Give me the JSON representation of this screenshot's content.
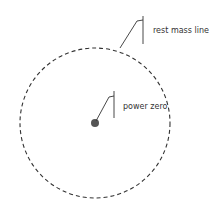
{
  "diagram": {
    "labels": {
      "rest_mass_line": "rest mass line",
      "power_zero": "power zero"
    },
    "colors": {
      "line": "#333333",
      "dot": "#555555",
      "background": "#ffffff"
    }
  }
}
